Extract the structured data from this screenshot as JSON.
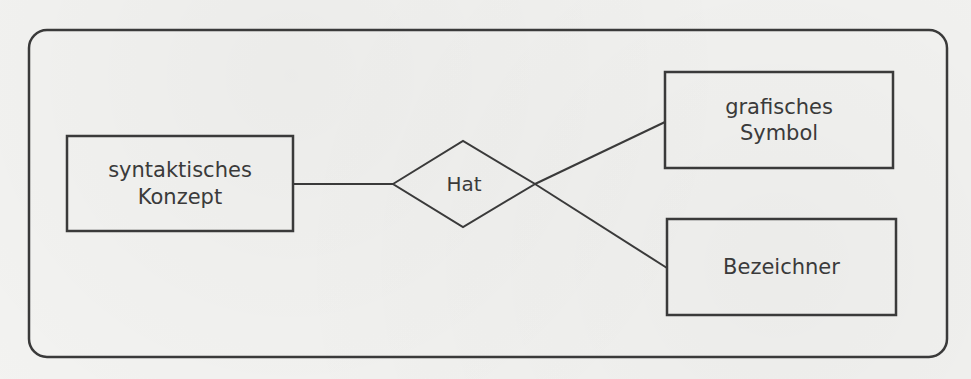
{
  "diagram": {
    "type": "entity-relationship",
    "frame": {
      "shape": "rounded-rectangle"
    },
    "entities": [
      {
        "id": "syntaktisches-konzept",
        "line1": "syntaktisches",
        "line2": "Konzept"
      },
      {
        "id": "grafisches-symbol",
        "line1": "grafisches",
        "line2": "Symbol"
      },
      {
        "id": "bezeichner",
        "line1": "Bezeichner"
      }
    ],
    "relationship": {
      "id": "hat",
      "label": "Hat"
    },
    "connections": [
      {
        "from": "syntaktisches-konzept",
        "to": "hat"
      },
      {
        "from": "hat",
        "to": "grafisches-symbol"
      },
      {
        "from": "hat",
        "to": "bezeichner"
      }
    ],
    "colors": {
      "stroke": "#3a3a3a",
      "text": "#3a3a3a",
      "background": "#f3f3f1"
    }
  }
}
